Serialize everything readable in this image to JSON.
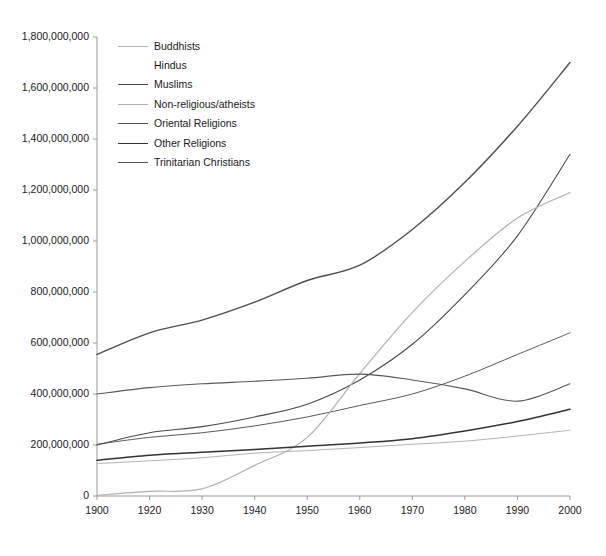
{
  "chart_data": {
    "type": "line",
    "title": "",
    "subtitle": "",
    "xlabel": "",
    "ylabel": "",
    "x": [
      "1900",
      "1920",
      "1930",
      "1940",
      "1950",
      "1960",
      "1970",
      "1980",
      "1990",
      "2000"
    ],
    "xtick_labels": [
      "1900",
      "1920",
      "1930",
      "1940",
      "1950",
      "1960",
      "1970",
      "1980",
      "1990",
      "2000"
    ],
    "ytick_labels": [
      "0",
      "200,000,000",
      "400,000,000",
      "600,000,000",
      "800,000,000",
      "1,000,000,000",
      "1,200,000,000",
      "1,400,000,000",
      "1,600,000,000",
      "1,800,000,000"
    ],
    "ytick_values": [
      0,
      200000000,
      400000000,
      600000000,
      800000000,
      1000000000,
      1200000000,
      1400000000,
      1600000000,
      1800000000
    ],
    "ylim": [
      0,
      1800000000
    ],
    "grid": false,
    "legend_position": "inside-top-left",
    "series": [
      {
        "name": "Buddhists",
        "color": "#b4b4b4",
        "width": 1.0,
        "values": [
          127000000,
          138000000,
          150000000,
          168000000,
          178000000,
          190000000,
          203000000,
          215000000,
          235000000,
          258000000
        ]
      },
      {
        "name": "Hindus",
        "color": "#5a5a5a",
        "width": 1.0,
        "values": [
          203000000,
          230000000,
          248000000,
          275000000,
          310000000,
          355000000,
          400000000,
          470000000,
          555000000,
          640000000
        ]
      },
      {
        "name": "Muslims",
        "color": "#4a4a4a",
        "width": 1.1,
        "values": [
          200000000,
          248000000,
          272000000,
          310000000,
          360000000,
          455000000,
          595000000,
          790000000,
          1020000000,
          1340000000
        ]
      },
      {
        "name": "Non-religious/atheists",
        "color": "#b0b0b0",
        "width": 1.2,
        "values": [
          3000000,
          18000000,
          28000000,
          120000000,
          230000000,
          480000000,
          720000000,
          920000000,
          1090000000,
          1190000000
        ]
      },
      {
        "name": "Oriental Religions",
        "color": "#585858",
        "width": 1.1,
        "values": [
          400000000,
          425000000,
          440000000,
          450000000,
          462000000,
          478000000,
          455000000,
          420000000,
          372000000,
          440000000
        ]
      },
      {
        "name": "Other Religions",
        "color": "#333333",
        "width": 1.5,
        "values": [
          140000000,
          160000000,
          172000000,
          182000000,
          195000000,
          208000000,
          225000000,
          255000000,
          292000000,
          340000000
        ]
      },
      {
        "name": "Trinitarian Christians",
        "color": "#4f4f4f",
        "width": 1.4,
        "values": [
          555000000,
          640000000,
          690000000,
          760000000,
          845000000,
          905000000,
          1045000000,
          1230000000,
          1450000000,
          1700000000
        ]
      }
    ]
  },
  "legend": {
    "entries": [
      {
        "label": "Buddhists"
      },
      {
        "label": "Hindus"
      },
      {
        "label": "Muslims"
      },
      {
        "label": "Non-religious/atheists"
      },
      {
        "label": "Oriental Religions"
      },
      {
        "label": "Other Religions"
      },
      {
        "label": "Trinitarian Christians"
      }
    ]
  },
  "axes": {
    "axis_color": "#9a9a9a",
    "tick_color": "#9a9a9a",
    "label_color": "#1a1a1a"
  }
}
